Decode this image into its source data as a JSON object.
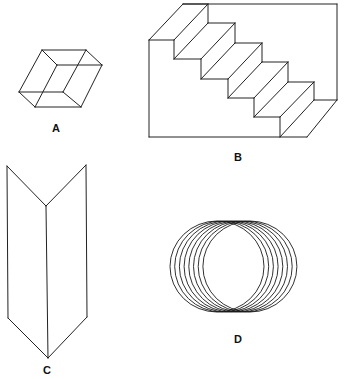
{
  "figures": [
    {
      "id": "A",
      "label": "A",
      "description": "ambiguous rhombic cube (Necker-type)",
      "label_pos": [
        56,
        128
      ],
      "lines": [
        [
          42,
          50,
          86,
          50
        ],
        [
          86,
          50,
          102,
          65
        ],
        [
          102,
          65,
          81,
          107
        ],
        [
          81,
          107,
          35,
          107
        ],
        [
          35,
          107,
          19,
          92
        ],
        [
          19,
          92,
          42,
          50
        ],
        [
          42,
          50,
          57,
          65
        ],
        [
          57,
          65,
          102,
          65
        ],
        [
          57,
          65,
          35,
          107
        ],
        [
          86,
          50,
          63,
          92
        ],
        [
          19,
          92,
          63,
          92
        ],
        [
          63,
          92,
          81,
          107
        ]
      ]
    },
    {
      "id": "B",
      "label": "B",
      "description": "Schroder reversible staircase",
      "label_pos": [
        238,
        157
      ],
      "lines": [
        [
          183,
          4,
          337,
          4
        ],
        [
          337,
          4,
          337,
          100
        ],
        [
          149,
          40,
          149,
          137
        ],
        [
          149,
          137,
          307,
          137
        ],
        [
          149,
          40,
          183,
          4
        ],
        [
          183,
          4,
          208,
          4
        ],
        [
          149,
          40,
          174,
          40
        ],
        [
          174,
          40,
          208,
          4
        ],
        [
          174,
          40,
          174,
          59
        ],
        [
          208,
          4,
          208,
          23
        ],
        [
          174,
          59,
          201,
          59
        ],
        [
          201,
          59,
          235,
          23
        ],
        [
          208,
          23,
          235,
          23
        ],
        [
          174,
          59,
          208,
          23
        ],
        [
          201,
          59,
          201,
          79
        ],
        [
          235,
          23,
          235,
          43
        ],
        [
          201,
          79,
          228,
          79
        ],
        [
          228,
          79,
          262,
          43
        ],
        [
          235,
          43,
          262,
          43
        ],
        [
          201,
          79,
          235,
          43
        ],
        [
          228,
          79,
          228,
          98
        ],
        [
          262,
          43,
          262,
          62
        ],
        [
          228,
          98,
          254,
          98
        ],
        [
          254,
          98,
          288,
          62
        ],
        [
          262,
          62,
          288,
          62
        ],
        [
          228,
          98,
          262,
          62
        ],
        [
          254,
          98,
          254,
          117
        ],
        [
          288,
          62,
          288,
          82
        ],
        [
          254,
          117,
          280,
          117
        ],
        [
          280,
          117,
          314,
          82
        ],
        [
          288,
          82,
          314,
          82
        ],
        [
          254,
          117,
          288,
          82
        ],
        [
          280,
          117,
          280,
          137
        ],
        [
          314,
          82,
          314,
          100
        ],
        [
          280,
          137,
          314,
          100
        ],
        [
          314,
          100,
          337,
          100
        ],
        [
          307,
          137,
          337,
          100
        ]
      ]
    },
    {
      "id": "C",
      "label": "C",
      "description": "ambiguous folded card (Mach book)",
      "label_pos": [
        47,
        370
      ],
      "lines": [
        [
          7,
          166,
          46,
          206
        ],
        [
          46,
          206,
          86,
          165
        ],
        [
          7,
          166,
          8,
          318
        ],
        [
          86,
          165,
          87,
          317
        ],
        [
          46,
          206,
          48,
          358
        ],
        [
          8,
          318,
          48,
          358
        ],
        [
          48,
          358,
          87,
          317
        ]
      ]
    },
    {
      "id": "D",
      "label": "D",
      "description": "overlapping rings (ambiguous coil)",
      "label_pos": [
        238,
        339
      ],
      "rings": {
        "count": 8,
        "first_cx": 217,
        "spacing": 4.7,
        "cy": 266.5,
        "rx": 47,
        "ry": 45.5
      }
    }
  ],
  "colors": {
    "ink": "#222222",
    "background": "#ffffff"
  }
}
